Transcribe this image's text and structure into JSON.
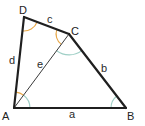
{
  "diagram": {
    "type": "quadrilateral",
    "colors": {
      "edge": "#1f1f1f",
      "diagonal": "#3a3a3a",
      "angle_orange": "#e8a849",
      "angle_teal": "#9fcfc6",
      "text": "#2a2a2a"
    },
    "vertices": {
      "A": {
        "label": "A",
        "x": 14,
        "y": 108
      },
      "B": {
        "label": "B",
        "x": 126,
        "y": 108
      },
      "C": {
        "label": "C",
        "x": 69,
        "y": 34
      },
      "D": {
        "label": "D",
        "x": 24,
        "y": 17
      }
    },
    "sides": {
      "a": {
        "label": "a",
        "from": "A",
        "to": "B"
      },
      "b": {
        "label": "b",
        "from": "B",
        "to": "C"
      },
      "c": {
        "label": "c",
        "from": "C",
        "to": "D"
      },
      "d": {
        "label": "d",
        "from": "D",
        "to": "A"
      },
      "e": {
        "label": "e",
        "from": "A",
        "to": "C",
        "kind": "diagonal"
      }
    },
    "angle_marks": [
      {
        "vertex": "D",
        "color": "orange"
      },
      {
        "vertex": "C",
        "triangle": "ACD",
        "color": "orange"
      },
      {
        "vertex": "A",
        "triangle": "ACD",
        "color": "orange"
      },
      {
        "vertex": "C",
        "triangle": "ABC",
        "color": "teal"
      },
      {
        "vertex": "A",
        "triangle": "ABC",
        "color": "teal"
      },
      {
        "vertex": "B",
        "color": "teal"
      }
    ]
  }
}
